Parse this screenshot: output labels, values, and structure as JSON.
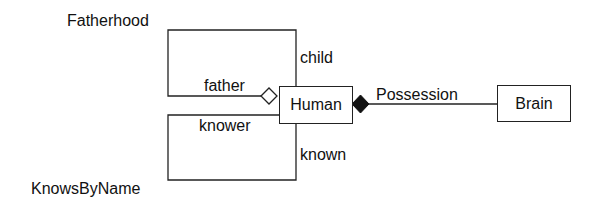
{
  "diagram": {
    "type": "UML class diagram",
    "classes": [
      {
        "id": "human",
        "name": "Human"
      },
      {
        "id": "brain",
        "name": "Brain"
      }
    ],
    "associations": [
      {
        "name": "Fatherhood",
        "type": "aggregation (hollow diamond)",
        "from": "Human",
        "to": "Human",
        "roles": {
          "aggregate": "father",
          "part": "child"
        }
      },
      {
        "name": "KnowsByName",
        "type": "association",
        "from": "Human",
        "to": "Human",
        "roles": {
          "source": "knower",
          "target": "known"
        }
      },
      {
        "name": "Possession",
        "type": "composition (filled diamond)",
        "from": "Human",
        "to": "Brain"
      }
    ],
    "labels": {
      "fatherhood": "Fatherhood",
      "child": "child",
      "father": "father",
      "knower": "knower",
      "known": "known",
      "knowsbyname": "KnowsByName",
      "possession": "Possession"
    },
    "colors": {
      "line": "#222222",
      "background": "#ffffff"
    }
  }
}
